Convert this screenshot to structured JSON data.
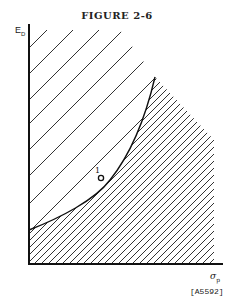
{
  "figure": {
    "title": "FIGURE 2-6",
    "y_axis_label": "E",
    "y_axis_sub": "D",
    "x_axis_label": "σ",
    "x_axis_sub": "p",
    "point_label": "1",
    "reference": "[A5592]"
  }
}
